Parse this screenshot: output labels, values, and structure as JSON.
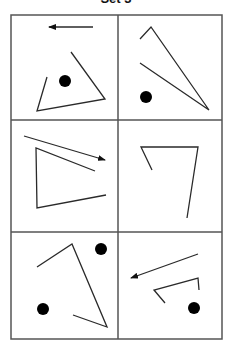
{
  "title": "Set 3",
  "colors": {
    "stroke": "#2a2a2a",
    "grid": "#555555",
    "dot": "#000000",
    "background": "#ffffff"
  },
  "grid": {
    "left": 11,
    "top": 15,
    "right": 222,
    "bottom": 339,
    "col_divider": 118,
    "row_dividers": [
      120,
      232
    ],
    "rows": 3,
    "cols": 2
  },
  "panels": [
    {
      "id": 1,
      "arrows": [
        {
          "from": [
            93,
            27
          ],
          "to": [
            49,
            27
          ]
        }
      ],
      "polylines": [
        [
          [
            47,
            77
          ],
          [
            37,
            111
          ],
          [
            105,
            99
          ],
          [
            71,
            52
          ]
        ]
      ],
      "dots": [
        {
          "cx": 65,
          "cy": 81,
          "r": 6
        }
      ]
    },
    {
      "id": 2,
      "arrows": [],
      "polylines": [
        [
          [
            140,
            39
          ],
          [
            151,
            27
          ],
          [
            209,
            110
          ],
          [
            140,
            63
          ]
        ]
      ],
      "dots": [
        {
          "cx": 146,
          "cy": 97,
          "r": 6
        }
      ]
    },
    {
      "id": 3,
      "arrows": [
        {
          "from": [
            24,
            136
          ],
          "to": [
            105,
            160
          ]
        }
      ],
      "polylines": [
        [
          [
            95,
            171
          ],
          [
            36,
            148
          ],
          [
            37,
            208
          ],
          [
            106,
            195
          ]
        ]
      ],
      "dots": []
    },
    {
      "id": 4,
      "arrows": [],
      "polylines": [
        [
          [
            152,
            170
          ],
          [
            141,
            147
          ],
          [
            198,
            147
          ],
          [
            187,
            218
          ]
        ]
      ],
      "dots": []
    },
    {
      "id": 5,
      "arrows": [],
      "polylines": [
        [
          [
            37,
            267
          ],
          [
            72,
            244
          ],
          [
            107,
            327
          ],
          [
            73,
            315
          ]
        ]
      ],
      "dots": [
        {
          "cx": 101,
          "cy": 249,
          "r": 6
        },
        {
          "cx": 43,
          "cy": 309,
          "r": 6
        }
      ]
    },
    {
      "id": 6,
      "arrows": [
        {
          "from": [
            198,
            254
          ],
          "to": [
            131,
            278
          ]
        }
      ],
      "polylines": [
        [
          [
            165,
            303
          ],
          [
            154,
            290
          ],
          [
            198,
            278
          ],
          [
            199,
            290
          ]
        ]
      ],
      "dots": [
        {
          "cx": 194,
          "cy": 308,
          "r": 6
        }
      ]
    }
  ]
}
